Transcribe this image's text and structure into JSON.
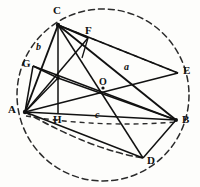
{
  "figure": {
    "caption": "",
    "type": "euclidean-geometry-diagram",
    "colors": {
      "ink": "#111111",
      "paper": "#fdfdfb",
      "dashed": "#2b2b2b"
    }
  },
  "circle": {
    "name": "circumcircle",
    "cx": 103,
    "cy": 95,
    "r": 86,
    "style": "dashed"
  },
  "arc": {
    "name": "auxiliary-arc",
    "style": "dashed",
    "path": "M 25 112 Q 92 146 143 158"
  },
  "points": {
    "A": {
      "label": "A",
      "x": 25,
      "y": 112,
      "label_x": 9,
      "label_y": 107
    },
    "B": {
      "label": "B",
      "x": 176,
      "y": 120,
      "label_x": 181,
      "label_y": 117
    },
    "C": {
      "label": "C",
      "x": 58,
      "y": 25,
      "label_x": 53,
      "label_y": 7
    },
    "D": {
      "label": "D",
      "x": 143,
      "y": 158,
      "label_x": 147,
      "label_y": 157
    },
    "E": {
      "label": "E",
      "x": 178,
      "y": 73,
      "label_x": 183,
      "label_y": 68
    },
    "F": {
      "label": "F",
      "x": 88,
      "y": 38,
      "label_x": 85,
      "label_y": 27
    },
    "G": {
      "label": "G",
      "x": 33,
      "y": 66,
      "label_x": 23,
      "label_y": 60
    },
    "H": {
      "label": "H",
      "x": 58,
      "y": 112,
      "label_x": 53,
      "label_y": 116
    },
    "O": {
      "label": "O",
      "x": 103,
      "y": 88,
      "label_x": 98,
      "label_y": 79
    }
  },
  "side_labels": {
    "a": {
      "label": "a",
      "x": 125,
      "y": 67
    },
    "b": {
      "label": "b",
      "x": 37,
      "y": 47
    },
    "c": {
      "label": "c",
      "x": 96,
      "y": 115
    }
  },
  "segments": [
    {
      "name": "side-AB",
      "from": "A",
      "to": "B",
      "style": "solid"
    },
    {
      "name": "side-AC",
      "from": "A",
      "to": "C",
      "style": "solid"
    },
    {
      "name": "side-CB",
      "from": "C",
      "to": "B",
      "style": "solid"
    },
    {
      "name": "altitude-C-H",
      "from": "C",
      "to": "H",
      "style": "solid"
    },
    {
      "name": "cevian-C-D",
      "from": "C",
      "to": "D",
      "style": "solid"
    },
    {
      "name": "cevian-A-E",
      "from": "A",
      "to": "E",
      "style": "solid"
    },
    {
      "name": "cevian-G-B",
      "from": "G",
      "to": "B",
      "style": "solid"
    },
    {
      "name": "segment-A-G",
      "from": "A",
      "to": "G",
      "style": "solid"
    },
    {
      "name": "segment-A-F",
      "from": "A",
      "to": "F",
      "style": "solid"
    },
    {
      "name": "segment-C-F",
      "from": "C",
      "to": "F",
      "style": "solid"
    },
    {
      "name": "segment-C-E",
      "from": "C",
      "to": "E",
      "style": "solid"
    },
    {
      "name": "segment-D-B",
      "from": "D",
      "to": "B",
      "style": "solid"
    },
    {
      "name": "segment-A-D",
      "from": "A",
      "to": "D",
      "style": "solid"
    },
    {
      "name": "segment-F-B",
      "from": "F",
      "to": "B",
      "style": "solid"
    },
    {
      "name": "chord-C-E-dashed",
      "from": "C",
      "to": "E",
      "style": "dashed"
    },
    {
      "name": "chord-A-B-dashed",
      "from": "A",
      "to": "B",
      "style": "dashed"
    }
  ]
}
